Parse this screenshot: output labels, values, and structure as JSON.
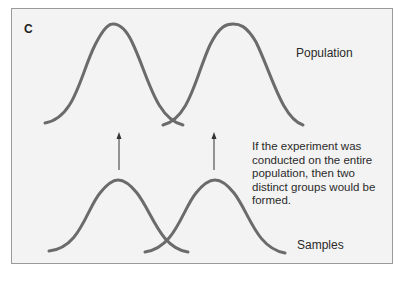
{
  "panel_label": "C",
  "labels": {
    "population": "Population",
    "samples": "Samples"
  },
  "note": "If the experiment was conducted on the entire population, then two distinct groups would be formed.",
  "colors": {
    "curve": "#6b6b6b",
    "arrow": "#333333",
    "background": "#f3f3f3",
    "border": "#9a9a9a"
  },
  "diagram": {
    "population_curves": 2,
    "sample_curves": 2,
    "arrows": 2
  }
}
